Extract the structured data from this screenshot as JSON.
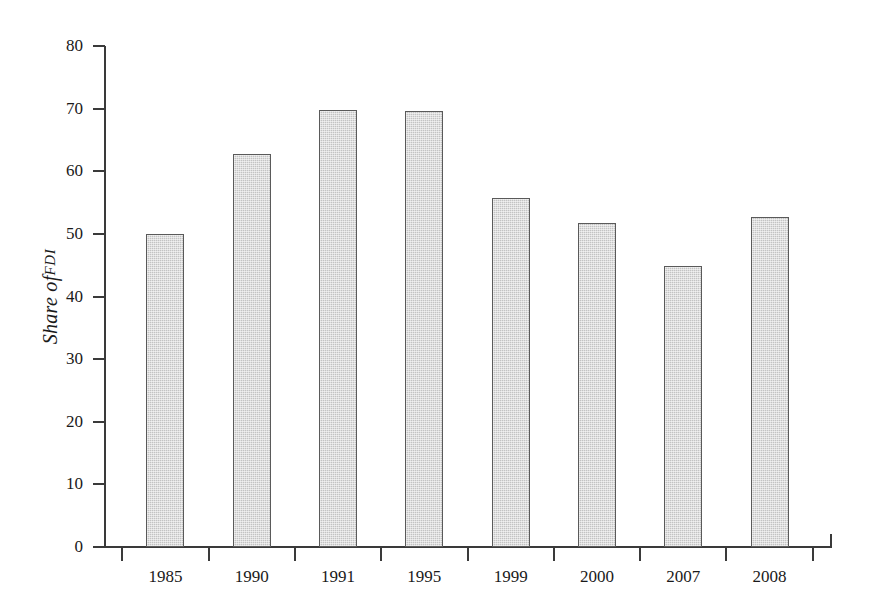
{
  "chart_data": {
    "type": "bar",
    "title": "",
    "subtitle": "",
    "xlabel": "",
    "ylabel": "Share of FDI",
    "ylabel_main": "Share of ",
    "ylabel_smallcaps": "FDI",
    "categories": [
      "1985",
      "1990",
      "1991",
      "1995",
      "1999",
      "2000",
      "2007",
      "2008"
    ],
    "values": [
      50.0,
      62.8,
      69.8,
      69.7,
      55.8,
      51.8,
      44.8,
      52.7
    ],
    "series": [
      {
        "name": "Share of FDI",
        "values": [
          50.0,
          62.8,
          69.8,
          69.7,
          55.8,
          51.8,
          44.8,
          52.7
        ]
      }
    ],
    "ylim": [
      0,
      80
    ],
    "yticks": [
      0,
      10,
      20,
      30,
      40,
      50,
      60,
      70,
      80
    ],
    "ytick_labels": [
      "0",
      "10",
      "20",
      "30",
      "40",
      "50",
      "60",
      "70",
      "80"
    ],
    "xtick_labels": [
      "1985",
      "1990",
      "1991",
      "1995",
      "1999",
      "2000",
      "2007",
      "2008"
    ],
    "grid": false,
    "legend": null,
    "legend_position": "none",
    "bar_fill_color": "#c3c3c3",
    "bar_edge_color": "#5a5a5a",
    "axis_color": "#3a3a3a",
    "background_color": "#ffffff",
    "annotations": []
  }
}
